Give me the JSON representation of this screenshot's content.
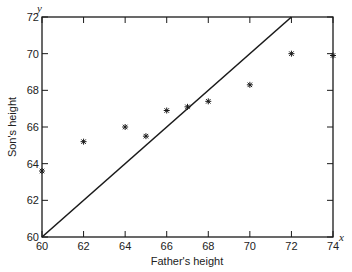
{
  "chart_data": {
    "type": "scatter",
    "title": "",
    "xlabel": "Father's height",
    "ylabel": "Son's height",
    "x_axis_var": "x",
    "y_axis_var": "y",
    "xlim": [
      60,
      74
    ],
    "ylim": [
      60,
      72
    ],
    "x_ticks": [
      60,
      62,
      64,
      66,
      68,
      70,
      72,
      74
    ],
    "y_ticks": [
      60,
      62,
      64,
      66,
      68,
      70,
      72
    ],
    "grid": false,
    "marker": "asterisk",
    "series": [
      {
        "name": "observations",
        "points": [
          {
            "x": 60,
            "y": 63.6
          },
          {
            "x": 62,
            "y": 65.2
          },
          {
            "x": 64,
            "y": 66.0
          },
          {
            "x": 65,
            "y": 65.5
          },
          {
            "x": 66,
            "y": 66.9
          },
          {
            "x": 67,
            "y": 67.1
          },
          {
            "x": 68,
            "y": 67.4
          },
          {
            "x": 70,
            "y": 68.3
          },
          {
            "x": 72,
            "y": 70.0
          },
          {
            "x": 74,
            "y": 69.9
          }
        ]
      }
    ],
    "reference_line": {
      "name": "y = x",
      "from": [
        60,
        60
      ],
      "to": [
        72,
        72
      ]
    }
  },
  "colors": {
    "ink": "#1a1a1a",
    "background": "#ffffff"
  }
}
